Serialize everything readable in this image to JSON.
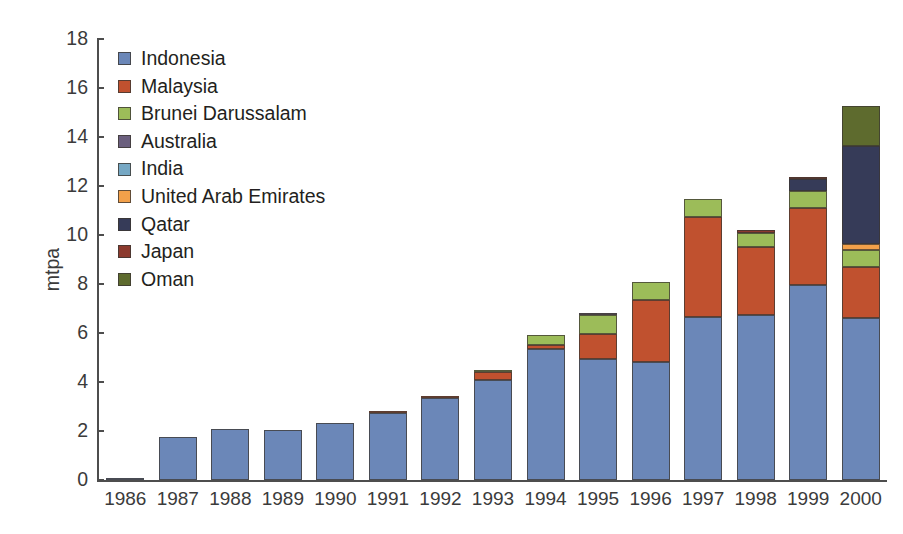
{
  "chart_data": {
    "type": "bar",
    "subtype": "stacked-vertical",
    "title": "",
    "xlabel": "",
    "ylabel": "mtpa",
    "ylim": [
      0,
      18
    ],
    "yticks": [
      0,
      2,
      4,
      6,
      8,
      10,
      12,
      14,
      16,
      18
    ],
    "ytick_labels": [
      "0",
      "2",
      "4",
      "6",
      "8",
      "10",
      "12",
      "14",
      "16",
      "18"
    ],
    "grid": false,
    "legend_position": "upper-left-inside",
    "categories": [
      "1986",
      "1987",
      "1988",
      "1989",
      "1990",
      "1991",
      "1992",
      "1993",
      "1994",
      "1995",
      "1996",
      "1997",
      "1998",
      "1999",
      "2000"
    ],
    "series": [
      {
        "name": "Indonesia",
        "color": "#6b87b8",
        "values": [
          0.1,
          1.75,
          2.1,
          2.05,
          2.33,
          2.75,
          3.35,
          4.1,
          5.35,
          4.95,
          4.8,
          6.65,
          6.75,
          7.95,
          6.6
        ]
      },
      {
        "name": "Malaysia",
        "color": "#c0512f",
        "values": [
          0,
          0,
          0,
          0,
          0,
          0.07,
          0.07,
          0.3,
          0.18,
          1.0,
          2.55,
          4.1,
          2.75,
          3.15,
          2.1
        ]
      },
      {
        "name": "Brunei Darussalam",
        "color": "#9cbc59",
        "values": [
          0,
          0,
          0,
          0,
          0,
          0,
          0,
          0.08,
          0.38,
          0.8,
          0.75,
          0.72,
          0.6,
          0.7,
          0.7
        ]
      },
      {
        "name": "Australia",
        "color": "#6b5f7e",
        "values": [
          0,
          0,
          0,
          0,
          0,
          0,
          0,
          0,
          0,
          0.03,
          0,
          0,
          0,
          0,
          0
        ]
      },
      {
        "name": "India",
        "color": "#76a8c4",
        "values": [
          0,
          0,
          0,
          0,
          0,
          0,
          0,
          0,
          0,
          0,
          0,
          0,
          0,
          0,
          0
        ]
      },
      {
        "name": "United Arab Emirates",
        "color": "#f2a04a",
        "values": [
          0,
          0,
          0,
          0,
          0,
          0,
          0,
          0,
          0,
          0,
          0,
          0,
          0,
          0,
          0.22
        ]
      },
      {
        "name": "Qatar",
        "color": "#363b58",
        "values": [
          0,
          0,
          0,
          0,
          0,
          0,
          0,
          0,
          0,
          0,
          0,
          0,
          0,
          0.5,
          4.03
        ]
      },
      {
        "name": "Japan",
        "color": "#8c3a2e",
        "values": [
          0,
          0,
          0,
          0,
          0,
          0,
          0,
          0,
          0,
          0,
          0,
          0,
          0.12,
          0.02,
          0
        ]
      },
      {
        "name": "Oman",
        "color": "#5e6b2e",
        "values": [
          0,
          0,
          0,
          0,
          0,
          0,
          0,
          0,
          0,
          0,
          0,
          0,
          0,
          0,
          1.6
        ]
      }
    ],
    "totals": [
      0.1,
      1.75,
      2.1,
      2.05,
      2.33,
      2.82,
      3.42,
      4.48,
      5.91,
      6.78,
      8.1,
      11.47,
      10.22,
      12.32,
      15.25
    ]
  },
  "legend": {
    "items": [
      {
        "label": "Indonesia",
        "color": "#6b87b8"
      },
      {
        "label": "Malaysia",
        "color": "#c0512f"
      },
      {
        "label": "Brunei Darussalam",
        "color": "#9cbc59"
      },
      {
        "label": "Australia",
        "color": "#6b5f7e"
      },
      {
        "label": "India",
        "color": "#76a8c4"
      },
      {
        "label": "United Arab Emirates",
        "color": "#f2a04a"
      },
      {
        "label": "Qatar",
        "color": "#363b58"
      },
      {
        "label": "Japan",
        "color": "#8c3a2e"
      },
      {
        "label": "Oman",
        "color": "#5e6b2e"
      }
    ]
  },
  "axes": {
    "y_title": "mtpa",
    "axis_color": "#4d4d4d",
    "text_color": "#3b3b3b"
  }
}
